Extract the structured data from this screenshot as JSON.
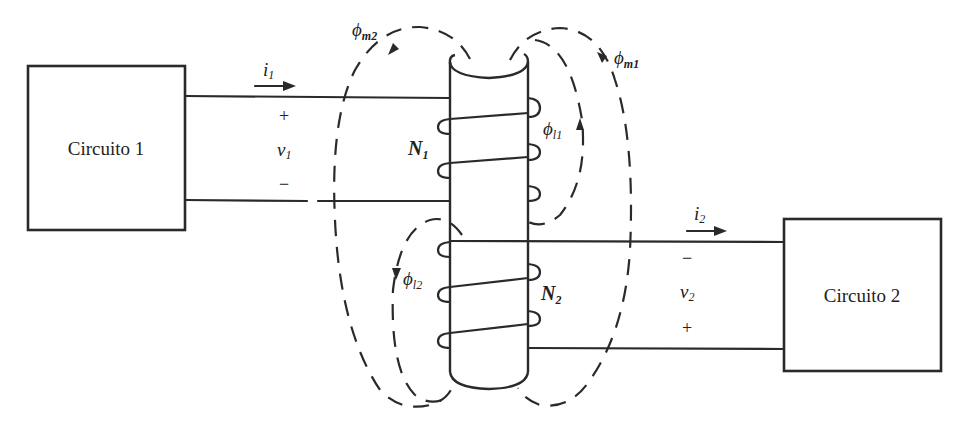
{
  "blocks": {
    "circuit1": {
      "label": "Circuito 1"
    },
    "circuit2": {
      "label": "Circuito 2"
    }
  },
  "port1": {
    "current": {
      "symbol": "i",
      "sub": "1"
    },
    "voltage": {
      "symbol": "v",
      "sub": "1"
    },
    "top_sign": "+",
    "bottom_sign": "−"
  },
  "port2": {
    "current": {
      "symbol": "i",
      "sub": "2"
    },
    "voltage": {
      "symbol": "v",
      "sub": "2"
    },
    "top_sign": "−",
    "bottom_sign": "+"
  },
  "windings": {
    "primary": {
      "symbol": "N",
      "sub": "1"
    },
    "secondary": {
      "symbol": "N",
      "sub": "2"
    }
  },
  "fluxes": {
    "mutual1": {
      "symbol": "ϕ",
      "sub": "m1"
    },
    "mutual2": {
      "symbol": "ϕ",
      "sub": "m2"
    },
    "leakage1": {
      "symbol": "ϕ",
      "sub": "l1"
    },
    "leakage2": {
      "symbol": "ϕ",
      "sub": "l2"
    }
  },
  "colors": {
    "ink": "#2a2a2a",
    "background": "#ffffff"
  }
}
